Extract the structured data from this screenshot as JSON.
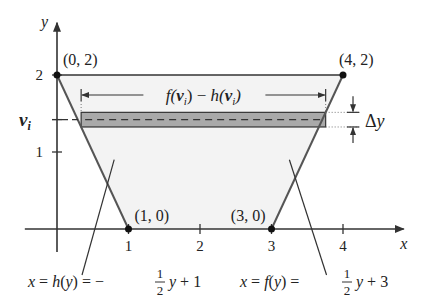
{
  "diagram": {
    "axes": {
      "x_label": "x",
      "y_label": "y",
      "x_ticks": [
        "1",
        "2",
        "3",
        "4"
      ],
      "y_ticks": [
        "1",
        "2"
      ],
      "y_strip_label": "v",
      "y_strip_subscript": "i",
      "x_range": [
        -0.4,
        4.9
      ],
      "y_range": [
        -0.3,
        2.7
      ]
    },
    "points": [
      {
        "label": "(0, 2)",
        "x": 0,
        "y": 2
      },
      {
        "label": "(4, 2)",
        "x": 4,
        "y": 2
      },
      {
        "label": "(1, 0)",
        "x": 1,
        "y": 0
      },
      {
        "label": "(3, 0)",
        "x": 3,
        "y": 0
      }
    ],
    "strip": {
      "y_center": 1.42,
      "height": 0.19,
      "width_label": "f(vᵢ) − h(vᵢ)",
      "width_label_parts": {
        "f": "f(",
        "v": "v",
        "i": "i",
        "mid": ") − h(",
        "end": ")"
      },
      "delta_label": "Δy"
    },
    "curves": {
      "h": {
        "lhs": "x = h(y) = −",
        "num": "1",
        "den": "2",
        "rhs": "y + 1",
        "slope": -0.5,
        "intercept": 1
      },
      "f": {
        "lhs": "x = f(y) = ",
        "num": "1",
        "den": "2",
        "rhs": "y + 3",
        "slope": 0.5,
        "intercept": 3
      }
    },
    "colors": {
      "region_fill": "#f3f3f3",
      "strip_fill": "#a9a9a9",
      "line": "#333333"
    }
  }
}
